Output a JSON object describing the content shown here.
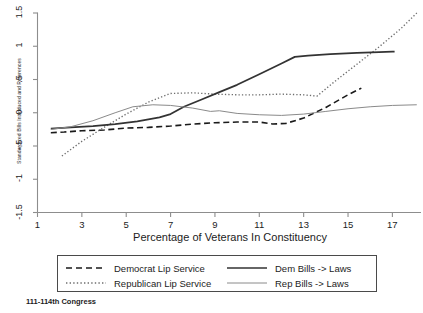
{
  "footnote": "111-114th Congress",
  "axes": {
    "y_title": "Standardized Bills Introduced and References",
    "x_title": "Percentage of Veterans In Constituency",
    "y_ticks": [
      "1.5",
      "1",
      ".5",
      "0",
      "-.5",
      "-1",
      "-1.5"
    ],
    "x_ticks": [
      "1",
      "3",
      "5",
      "7",
      "9",
      "11",
      "13",
      "15",
      "17"
    ]
  },
  "legend": {
    "items": [
      {
        "label": "Democrat Lip Service",
        "style": "dashed",
        "color": "#1a1a1a",
        "icon": "dashed-line-icon"
      },
      {
        "label": "Republican Lip Service",
        "style": "dotted",
        "color": "#6e6e6e",
        "icon": "dotted-line-icon"
      },
      {
        "label": "Dem Bills -> Laws",
        "style": "solid-thick",
        "color": "#333333",
        "icon": "solid-line-icon"
      },
      {
        "label": "Rep Bills -> Laws",
        "style": "solid-thin",
        "color": "#8a8a8a",
        "icon": "solid-thin-line-icon"
      }
    ]
  },
  "chart_data": {
    "type": "line",
    "title": "",
    "subtitle": "",
    "xlabel": "Percentage of Veterans In Constituency",
    "ylabel": "Standardized Bills Introduced and References",
    "xlim": [
      1,
      18.2
    ],
    "ylim": [
      -1.5,
      1.5
    ],
    "xticks": [
      1,
      3,
      5,
      7,
      9,
      11,
      13,
      15,
      17
    ],
    "yticks": [
      -1.5,
      -1,
      -0.5,
      0,
      0.5,
      1,
      1.5
    ],
    "grid": false,
    "legend_position": "below-plot",
    "annotation": "111-114th Congress",
    "series": [
      {
        "name": "Democrat Lip Service",
        "style": "dashed",
        "color": "#1a1a1a",
        "x": [
          1.6,
          2.2,
          3.0,
          4.0,
          5.0,
          6.0,
          7.0,
          8.0,
          9.0,
          10.0,
          11.0,
          11.6,
          12.2,
          13.0,
          14.0,
          15.0,
          15.6
        ],
        "y": [
          -0.3,
          -0.29,
          -0.27,
          -0.26,
          -0.23,
          -0.22,
          -0.2,
          -0.17,
          -0.15,
          -0.14,
          -0.14,
          -0.17,
          -0.16,
          -0.08,
          0.08,
          0.27,
          0.37
        ]
      },
      {
        "name": "Republican Lip Service",
        "style": "dotted",
        "color": "#6e6e6e",
        "x": [
          2.1,
          3.0,
          4.0,
          5.0,
          6.0,
          7.0,
          8.0,
          9.0,
          10.0,
          11.0,
          12.0,
          13.0,
          13.6,
          14.4,
          15.4,
          16.4,
          17.4,
          18.1
        ],
        "y": [
          -0.65,
          -0.43,
          -0.22,
          -0.02,
          0.16,
          0.29,
          0.3,
          0.28,
          0.27,
          0.27,
          0.28,
          0.27,
          0.25,
          0.47,
          0.73,
          0.99,
          1.27,
          1.5
        ]
      },
      {
        "name": "Dem Bills -> Laws",
        "style": "solid-thick",
        "color": "#333333",
        "x": [
          1.6,
          2.5,
          3.5,
          4.5,
          5.5,
          6.5,
          7.0,
          7.6,
          8.4,
          9.2,
          10.0,
          11.0,
          12.0,
          12.6,
          13.2,
          14.2,
          15.4,
          16.4,
          17.0,
          17.1
        ],
        "y": [
          -0.24,
          -0.22,
          -0.2,
          -0.17,
          -0.13,
          -0.07,
          -0.02,
          0.09,
          0.2,
          0.31,
          0.42,
          0.58,
          0.74,
          0.84,
          0.86,
          0.88,
          0.9,
          0.91,
          0.92,
          0.92
        ]
      },
      {
        "name": "Rep Bills -> Laws",
        "style": "solid-thin",
        "color": "#8a8a8a",
        "x": [
          1.6,
          2.5,
          3.5,
          4.5,
          5.3,
          6.2,
          7.0,
          8.0,
          8.8,
          9.2,
          10.0,
          11.0,
          12.0,
          13.0,
          14.0,
          15.0,
          16.0,
          17.0,
          18.1
        ],
        "y": [
          -0.25,
          -0.21,
          -0.12,
          0.0,
          0.09,
          0.12,
          0.11,
          0.07,
          0.02,
          0.03,
          -0.01,
          -0.03,
          -0.04,
          -0.02,
          0.02,
          0.06,
          0.09,
          0.11,
          0.12
        ]
      }
    ]
  }
}
